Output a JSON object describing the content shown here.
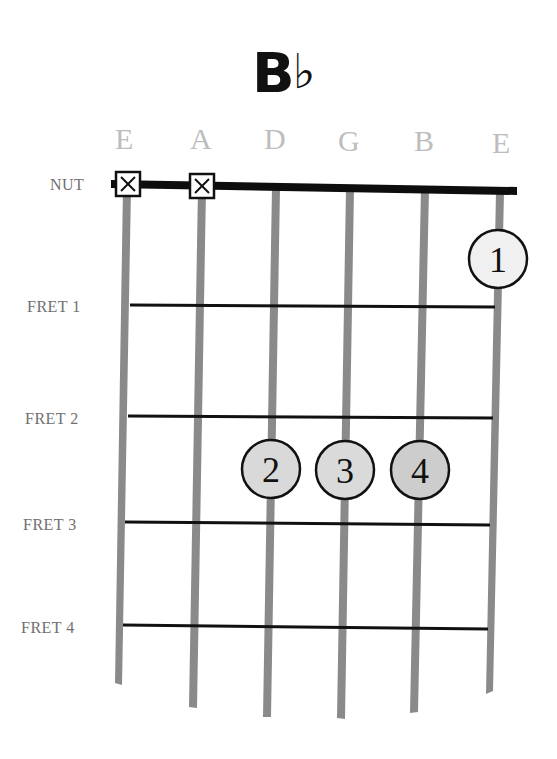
{
  "chord": {
    "root": "B",
    "accidental": "♭",
    "name": "B♭"
  },
  "strings": [
    {
      "label": "E",
      "x_top": 127,
      "x_bottom": 118,
      "y_bottom": 686,
      "muted": true
    },
    {
      "label": "A",
      "x_top": 202,
      "x_bottom": 193,
      "y_bottom": 707,
      "muted": true
    },
    {
      "label": "D",
      "x_top": 276,
      "x_bottom": 267,
      "y_bottom": 716,
      "muted": false
    },
    {
      "label": "G",
      "x_top": 350,
      "x_bottom": 341,
      "y_bottom": 718,
      "muted": false
    },
    {
      "label": "B",
      "x_top": 425,
      "x_bottom": 414,
      "y_bottom": 712,
      "muted": false
    },
    {
      "label": "E",
      "x_top": 500,
      "x_bottom": 489,
      "y_bottom": 693,
      "muted": false
    }
  ],
  "nut": {
    "label": "NUT"
  },
  "frets": [
    {
      "label": "FRET 1",
      "y": 306
    },
    {
      "label": "FRET 2",
      "y": 417
    },
    {
      "label": "FRET 3",
      "y": 523
    },
    {
      "label": "FRET 4",
      "y": 627
    }
  ],
  "fingers": [
    {
      "finger": "1",
      "string": "E (high)",
      "fret": 1,
      "cx": 498,
      "cy": 259,
      "fill": "#f0f0f0"
    },
    {
      "finger": "2",
      "string": "D",
      "fret": 3,
      "cx": 271,
      "cy": 469,
      "fill": "#d9d9d9"
    },
    {
      "finger": "3",
      "string": "G",
      "fret": 3,
      "cx": 345,
      "cy": 470,
      "fill": "#dadada"
    },
    {
      "finger": "4",
      "string": "B",
      "fret": 3,
      "cx": 420,
      "cy": 470,
      "fill": "#cdcdcd"
    }
  ],
  "mute_marker": {
    "symbol": "X"
  },
  "colors": {
    "string": "#8a8a8a",
    "nut": "#0d0d0d",
    "fret": "#111111",
    "string_label": "#bdbdbd",
    "fret_label": "#707070"
  }
}
